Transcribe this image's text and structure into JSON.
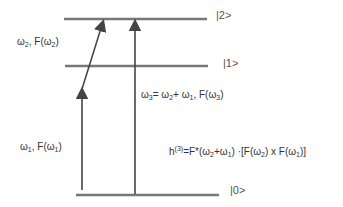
{
  "levels": [
    {
      "label": "|0>"
    },
    {
      "label": "|1>"
    },
    {
      "label": "|2>"
    }
  ],
  "labels": {
    "w1": {
      "sym": "ω",
      "sub": "1",
      "text": ", F(",
      "sym2": "ω",
      "sub2": "1",
      "close": ")"
    },
    "w2": {
      "sym": "ω",
      "sub": "2",
      "text": ", F(",
      "sym2": "ω",
      "sub2": "2",
      "close": ")"
    },
    "w3": {
      "a": "ω",
      "a_sub": "3",
      "b": "= ω",
      "b_sub": "2",
      "c": "+ ω",
      "c_sub": "1",
      "d": ", F(ω",
      "d_sub": "3",
      "e": ")"
    },
    "h3": {
      "h": "h",
      "sup": "(3)",
      "p1": "=F*(ω",
      "s1": "2",
      "p2": "+ω",
      "s2": "1",
      "p3": ") ·[F(ω",
      "s3": "2",
      "p4": ") x F(ω",
      "s4": "1",
      "p5": ")]"
    }
  },
  "colors": {
    "level_line": "#777777",
    "arrow": "#444444"
  }
}
